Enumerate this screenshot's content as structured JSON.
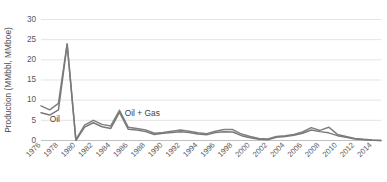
{
  "chart_data": {
    "type": "line",
    "title": "",
    "xlabel": "",
    "ylabel": "Production (MMbbl, MMboe)",
    "ylim": [
      0,
      30
    ],
    "xlim": [
      1976,
      2015
    ],
    "yticks": [
      0,
      5,
      10,
      15,
      20,
      25,
      30
    ],
    "ytick_labels": [
      "0",
      "5",
      "10",
      "15",
      "20",
      "25",
      "30"
    ],
    "xticks": [
      1976,
      1978,
      1980,
      1982,
      1984,
      1986,
      1988,
      1990,
      1992,
      1994,
      1996,
      1998,
      2000,
      2002,
      2004,
      2006,
      2008,
      2010,
      2012,
      2014
    ],
    "xtick_labels": [
      "1976",
      "1978",
      "1980",
      "1982",
      "1984",
      "1986",
      "1988",
      "1990",
      "1992",
      "1994",
      "1996",
      "1998",
      "2000",
      "2002",
      "2004",
      "2006",
      "2008",
      "2010",
      "2012",
      "2014"
    ],
    "grid": true,
    "legend_position": "inline-annotation",
    "x": [
      1976,
      1977,
      1978,
      1979,
      1980,
      1981,
      1982,
      1983,
      1984,
      1985,
      1986,
      1987,
      1988,
      1989,
      1990,
      1991,
      1992,
      1993,
      1994,
      1995,
      1996,
      1997,
      1998,
      1999,
      2000,
      2001,
      2002,
      2003,
      2004,
      2005,
      2006,
      2007,
      2008,
      2009,
      2010,
      2011,
      2012,
      2013,
      2014,
      2015
    ],
    "series": [
      {
        "name": "Oil + Gas",
        "color": "#808080",
        "values": [
          8.6,
          7.6,
          9.2,
          24.0,
          0.2,
          3.8,
          5.0,
          4.0,
          3.6,
          7.5,
          3.3,
          3.0,
          2.6,
          1.8,
          2.0,
          2.3,
          2.6,
          2.3,
          1.9,
          1.7,
          2.3,
          2.7,
          2.7,
          1.6,
          1.0,
          0.5,
          0.4,
          1.0,
          1.2,
          1.5,
          2.1,
          3.2,
          2.5,
          3.3,
          1.5,
          1.0,
          0.5,
          0.3,
          0.1,
          0.0
        ]
      },
      {
        "name": "Oil",
        "color": "#7a7a7a",
        "values": [
          6.9,
          6.3,
          7.6,
          23.8,
          0.0,
          3.3,
          4.4,
          3.4,
          3.0,
          7.0,
          2.8,
          2.6,
          2.2,
          1.5,
          1.8,
          2.0,
          2.2,
          2.0,
          1.6,
          1.4,
          2.0,
          2.2,
          2.1,
          1.2,
          0.7,
          0.3,
          0.2,
          0.8,
          1.0,
          1.3,
          1.8,
          2.6,
          2.2,
          1.9,
          1.2,
          0.8,
          0.4,
          0.2,
          0.05,
          0.0
        ]
      }
    ],
    "annotations": [
      {
        "text": "Oil",
        "x": 1977.0,
        "y": 4.6
      },
      {
        "text": "Oil + Gas",
        "x": 1985.6,
        "y": 6.1
      }
    ]
  },
  "colors": {
    "gridline": "#d9d9d9",
    "axis_text": "#595959",
    "series_gray": "#808080",
    "background": "#ffffff"
  }
}
